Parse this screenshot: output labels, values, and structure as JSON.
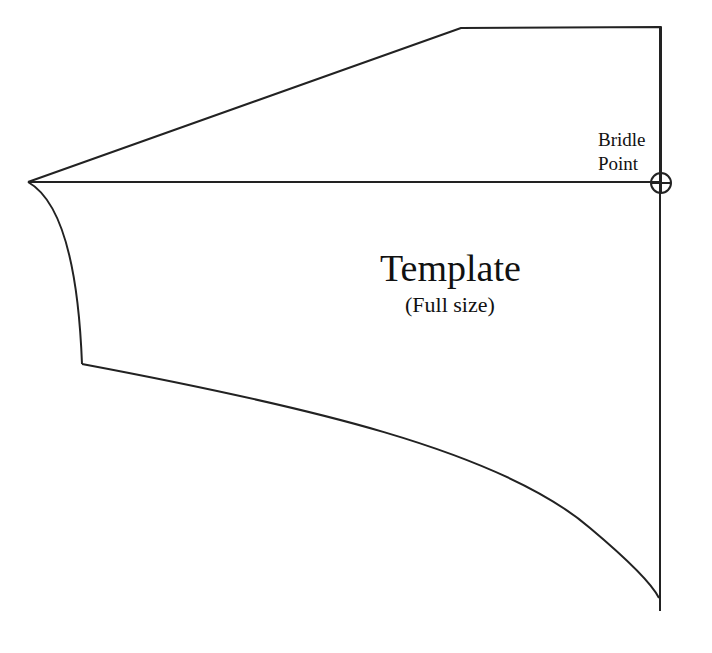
{
  "diagram": {
    "title": "Template",
    "subtitle": "(Full size)",
    "bridle_point": {
      "line1": "Bridle",
      "line2": "Point",
      "marker": "crosshair-circle"
    },
    "stroke_color": "#222222",
    "background_color": "#ffffff"
  }
}
